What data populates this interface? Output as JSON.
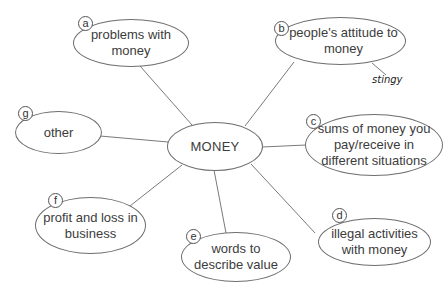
{
  "diagram": {
    "type": "mind-map",
    "center": {
      "label": "MONEY"
    },
    "branches": [
      {
        "letter": "a",
        "label": "problems with money"
      },
      {
        "letter": "b",
        "label": "people's attitude to money",
        "notes": [
          "stingy"
        ]
      },
      {
        "letter": "c",
        "label": "sums of money you pay/receive in different situations"
      },
      {
        "letter": "d",
        "label": "illegal activities with money"
      },
      {
        "letter": "e",
        "label": "words to describe value"
      },
      {
        "letter": "f",
        "label": "profit and loss in business"
      },
      {
        "letter": "g",
        "label": "other"
      }
    ]
  },
  "colors": {
    "line": "#6e6e6e",
    "text": "#3c3c3c",
    "background": "#ffffff"
  }
}
